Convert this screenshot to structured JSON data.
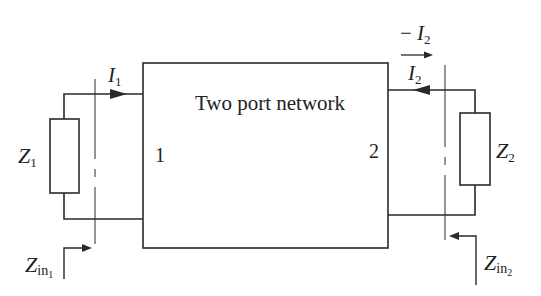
{
  "diagram": {
    "title": "Two port network",
    "port_labels": {
      "left": "1",
      "right": "2"
    },
    "currents": {
      "i1": {
        "main": "I",
        "sub": "1"
      },
      "i2": {
        "main": "I",
        "sub": "2"
      },
      "minus_i2": {
        "prefix": "− ",
        "main": "I",
        "sub": "2"
      }
    },
    "impedances": {
      "z1": {
        "main": "Z",
        "sub": "1"
      },
      "z2": {
        "main": "Z",
        "sub": "2"
      },
      "zin1": {
        "main": "Z",
        "sub": "in",
        "subsub": "1"
      },
      "zin2": {
        "main": "Z",
        "sub": "in",
        "subsub": "2"
      }
    },
    "colors": {
      "line": "#2a2a2a",
      "background": "#ffffff"
    }
  }
}
